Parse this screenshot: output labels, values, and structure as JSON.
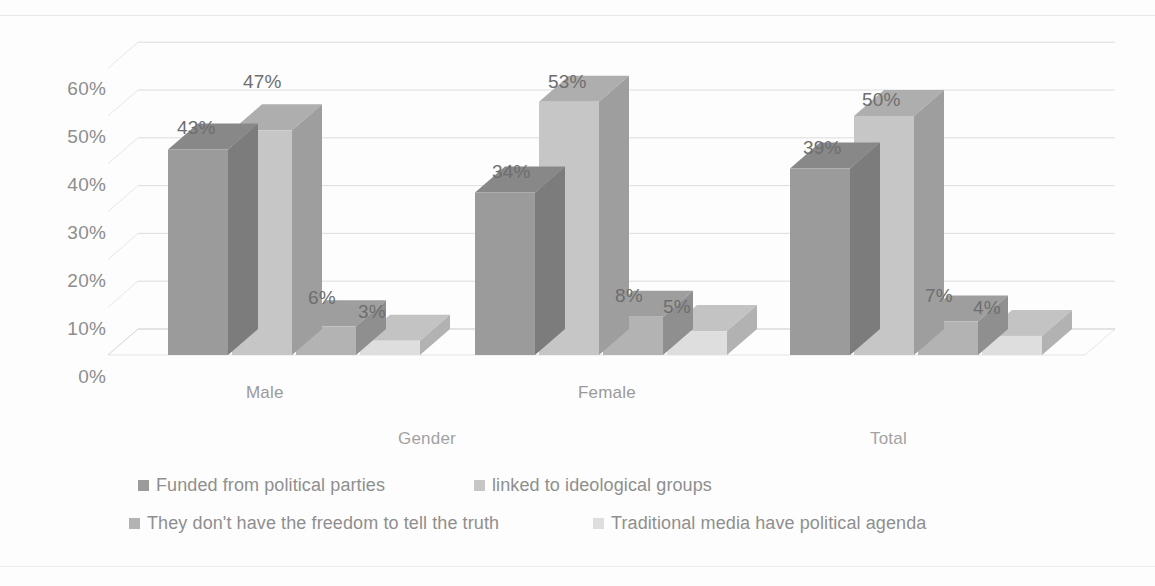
{
  "chart_data": {
    "type": "bar",
    "title": "",
    "subtitle": "",
    "xlabel": "",
    "ylabel": "",
    "ylim": [
      0,
      60
    ],
    "yticks": [
      "0%",
      "10%",
      "20%",
      "30%",
      "40%",
      "50%",
      "60%"
    ],
    "ytick_values": [
      0,
      10,
      20,
      30,
      40,
      50,
      60
    ],
    "grid": true,
    "three_d": true,
    "legend_position": "bottom",
    "categories": [
      "Male",
      "Female",
      "Total"
    ],
    "group_labels": [
      "Gender",
      "Total"
    ],
    "series": [
      {
        "name": "Funded from political parties",
        "color": "#9b9b9b",
        "values": [
          43,
          34,
          39
        ],
        "labels": [
          "43%",
          "34%",
          "39%"
        ]
      },
      {
        "name": "linked to ideological groups",
        "color": "#c6c6c6",
        "values": [
          47,
          53,
          50
        ],
        "labels": [
          "47%",
          "53%",
          "50%"
        ]
      },
      {
        "name": "They don't have the freedom to tell the truth",
        "color": "#b3b3b3",
        "values": [
          6,
          8,
          7
        ],
        "labels": [
          "6%",
          "8%",
          "7%"
        ]
      },
      {
        "name": "Traditional media have political agenda",
        "color": "#dedede",
        "values": [
          3,
          5,
          4
        ],
        "labels": [
          "3%",
          "5%",
          "4%"
        ]
      }
    ]
  },
  "axis": {
    "y_ticks": [
      {
        "text": "60%"
      },
      {
        "text": "50%"
      },
      {
        "text": "40%"
      },
      {
        "text": "30%"
      },
      {
        "text": "20%"
      },
      {
        "text": "10%"
      },
      {
        "text": "0%"
      }
    ],
    "categories": [
      {
        "text": "Male"
      },
      {
        "text": "Female"
      },
      {
        "text": "Total"
      }
    ],
    "groups": [
      {
        "text": "Gender"
      },
      {
        "text": "Total"
      }
    ]
  },
  "legend": {
    "items": [
      {
        "label": "Funded from political parties",
        "color": "#9b9b9b"
      },
      {
        "label": "linked to ideological groups",
        "color": "#c6c6c6"
      },
      {
        "label": "They don't have the freedom to tell the truth",
        "color": "#b3b3b3"
      },
      {
        "label": "Traditional media have political agenda",
        "color": "#dedede"
      }
    ]
  },
  "datalabels": [
    {
      "text": "43%"
    },
    {
      "text": "47%"
    },
    {
      "text": "6%"
    },
    {
      "text": "3%"
    },
    {
      "text": "34%"
    },
    {
      "text": "53%"
    },
    {
      "text": "8%"
    },
    {
      "text": "5%"
    },
    {
      "text": "39%"
    },
    {
      "text": "50%"
    },
    {
      "text": "7%"
    },
    {
      "text": "4%"
    }
  ]
}
